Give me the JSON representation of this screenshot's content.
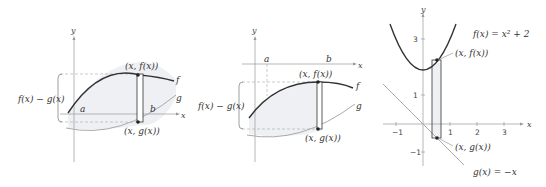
{
  "panels": [
    {
      "id": "panel-1",
      "axis_labels": {
        "x": "x",
        "y": "y"
      },
      "curve_labels": {
        "f": "f",
        "g": "g"
      },
      "bounds": {
        "a": "a",
        "b": "b"
      },
      "point_top": "(x, f(x))",
      "point_bottom": "(x, g(x))",
      "height_label": "f(x) − g(x)"
    },
    {
      "id": "panel-2",
      "axis_labels": {
        "x": "x",
        "y": "y"
      },
      "curve_labels": {
        "f": "f",
        "g": "g"
      },
      "bounds": {
        "a": "a",
        "b": "b"
      },
      "point_top": "(x, f(x))",
      "point_bottom": "(x, g(x))",
      "height_label": "f(x) − g(x)"
    },
    {
      "id": "panel-3",
      "axis_labels": {
        "x": "x",
        "y": "y"
      },
      "f_label": "f(x) = x² + 2",
      "g_label": "g(x) = −x",
      "point_top": "(x, f(x))",
      "point_bottom": "(x, g(x))",
      "x_ticks": [
        "−1",
        "1",
        "2",
        "3"
      ],
      "y_ticks": [
        "3",
        "1",
        "−1"
      ]
    }
  ],
  "colors": {
    "curve_f": "#333333",
    "curve_g": "#aaaaaa",
    "shade": "#eef0f3",
    "axis": "#999999",
    "dash": "#aaaaaa"
  }
}
